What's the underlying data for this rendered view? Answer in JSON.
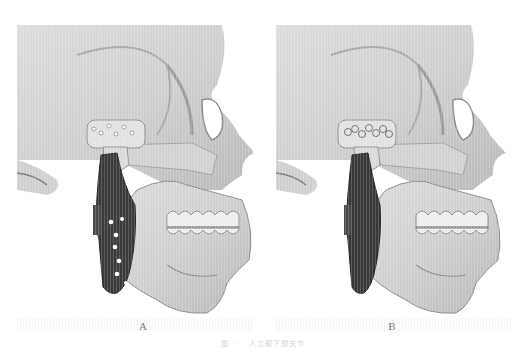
{
  "figure": {
    "panels": [
      {
        "id": "A",
        "label": "A",
        "description": "3D skull rendering (right lateral view) with a TMJ prosthesis: condylar fossa plate with screw holes and dark mandibular ramus plate with visible screw holes",
        "fossa_component": "dotted screw holes",
        "ramus_component": "dark plate with 7 screw holes"
      },
      {
        "id": "B",
        "label": "B",
        "description": "3D skull rendering (right lateral view) with a TMJ prosthesis: fossa component showing linked ring pattern and solid dark ramus plate",
        "fossa_component": "chain of rings",
        "ramus_component": "solid dark plate"
      }
    ],
    "caption": "图 · · · 人工颞下颌关节",
    "colors": {
      "background": "#ffffff",
      "bone_light": "#e6e6e6",
      "bone_mid": "#bdbdbd",
      "bone_shadow": "#7c7c7c",
      "implant_dark": "#3a3a3a",
      "label_text": "#7a7a7a"
    }
  }
}
